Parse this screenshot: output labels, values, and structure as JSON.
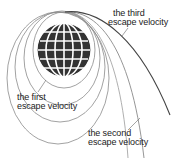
{
  "diagram": {
    "colors": {
      "globe_fill": "#333333",
      "grid_lines": "#ffffff",
      "orbit_lines": "#8a8a8a",
      "trajectory_third": "#444444",
      "text": "#222222"
    },
    "labels": {
      "third": {
        "line1": "the third",
        "line2": "escape velocity"
      },
      "first": {
        "line1": "the first",
        "line2": "escape velocity"
      },
      "second": {
        "line1": "the second",
        "line2": "escape velocity"
      }
    }
  }
}
